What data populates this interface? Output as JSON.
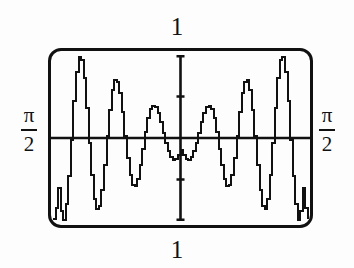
{
  "figure": {
    "caption_top": "1",
    "caption_bottom": "1",
    "left_label": {
      "numerator": "π",
      "denominator": "2"
    },
    "right_label": {
      "numerator": "π",
      "denominator": "2"
    },
    "frame": {
      "stroke_color": "#111111",
      "background_color": "#fdfdfd",
      "corner_radius": 13
    }
  },
  "chart_data": {
    "type": "line",
    "title": "",
    "subtitle": "",
    "xlabel": "",
    "ylabel": "",
    "xlim": [
      -1.5707963,
      1.5707963
    ],
    "ylim": [
      -1,
      1
    ],
    "xtick_labels": [
      "π/2",
      "π/2"
    ],
    "ytick_labels": [
      "1",
      "1"
    ],
    "grid": false,
    "legend": "none",
    "axes": {
      "x_axis_at_y": 0,
      "y_axis_at_x": 0,
      "y_axis_ticks": [
        -0.5,
        0.5
      ],
      "x_axis_ticks": []
    },
    "annotations": [
      "Window x-range is -π/2 to π/2 (labels π/2 at left and right of screen)",
      "Window y-range is -1 to 1 (labels 1 above and below screen)",
      "Curve is an even, symmetric oscillation whose amplitude and frequency grow toward the window edges"
    ],
    "series": [
      {
        "name": "curve",
        "x": [
          -1.5707963,
          -1.5394,
          -1.508,
          -1.4765,
          -1.4451,
          -1.4137,
          -1.3823,
          -1.3509,
          -1.3195,
          -1.288,
          -1.2566,
          -1.2252,
          -1.1938,
          -1.1624,
          -1.131,
          -1.0996,
          -1.0681,
          -1.0367,
          -1.0053,
          -0.9739,
          -0.9425,
          -0.9111,
          -0.8796,
          -0.8482,
          -0.8168,
          -0.7854,
          -0.754,
          -0.7226,
          -0.6912,
          -0.6597,
          -0.6283,
          -0.5969,
          -0.5655,
          -0.5341,
          -0.5027,
          -0.4712,
          -0.4398,
          -0.4084,
          -0.377,
          -0.3456,
          -0.3142,
          -0.2827,
          -0.2513,
          -0.2199,
          -0.1885,
          -0.1571,
          -0.1257,
          -0.0942,
          -0.0628,
          -0.0314,
          0,
          0.0314,
          0.0628,
          0.0942,
          0.1257,
          0.1571,
          0.1885,
          0.2199,
          0.2513,
          0.2827,
          0.3142,
          0.3456,
          0.377,
          0.4084,
          0.4398,
          0.4712,
          0.5027,
          0.5341,
          0.5655,
          0.5969,
          0.6283,
          0.6597,
          0.6912,
          0.7226,
          0.754,
          0.7854,
          0.8168,
          0.8482,
          0.8796,
          0.9111,
          0.9425,
          0.9739,
          1.0053,
          1.0367,
          1.0681,
          1.0996,
          1.131,
          1.1624,
          1.1938,
          1.2252,
          1.2566,
          1.288,
          1.3195,
          1.3509,
          1.3823,
          1.4137,
          1.4451,
          1.4765,
          1.508,
          1.5394,
          1.5707963
        ],
        "y": [
          -0.97,
          -0.84,
          -0.6,
          -0.88,
          -0.99,
          -0.8,
          -0.46,
          -0.02,
          0.45,
          0.8,
          0.97,
          0.94,
          0.72,
          0.36,
          -0.06,
          -0.45,
          -0.73,
          -0.86,
          -0.82,
          -0.63,
          -0.33,
          0.02,
          0.34,
          0.58,
          0.7,
          0.68,
          0.54,
          0.31,
          0.03,
          -0.24,
          -0.45,
          -0.57,
          -0.58,
          -0.49,
          -0.33,
          -0.13,
          0.07,
          0.24,
          0.35,
          0.39,
          0.37,
          0.3,
          0.19,
          0.06,
          -0.06,
          -0.16,
          -0.23,
          -0.26,
          -0.25,
          -0.21,
          -0.15,
          -0.21,
          -0.25,
          -0.26,
          -0.23,
          -0.16,
          -0.06,
          0.06,
          0.19,
          0.3,
          0.37,
          0.39,
          0.35,
          0.24,
          0.07,
          -0.13,
          -0.33,
          -0.49,
          -0.58,
          -0.57,
          -0.45,
          -0.24,
          0.03,
          0.31,
          0.54,
          0.68,
          0.7,
          0.58,
          0.34,
          0.02,
          -0.33,
          -0.63,
          -0.82,
          -0.86,
          -0.73,
          -0.45,
          -0.06,
          0.36,
          0.72,
          0.94,
          0.97,
          0.8,
          0.45,
          -0.02,
          -0.46,
          -0.8,
          -0.99,
          -0.88,
          -0.6,
          -0.84,
          -0.97
        ]
      }
    ]
  }
}
